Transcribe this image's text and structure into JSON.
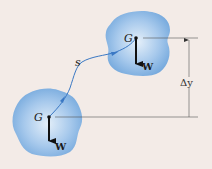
{
  "diagram": {
    "background": "#f3ebe7",
    "blob_color": "#7fb0e0",
    "blob_center_color": "#dceaf7",
    "path_color": "#3a78c4",
    "labels": {
      "center_of_gravity_top": "G",
      "center_of_gravity_bottom": "G",
      "weight_top": "W",
      "weight_bottom": "W",
      "path": "s",
      "vertical_displacement": "Δy"
    }
  }
}
